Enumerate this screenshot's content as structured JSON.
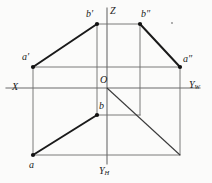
{
  "figure": {
    "kind": "descriptive-geometry-three-view-projection",
    "background_color": "#fbfbfa",
    "ink_color": "#1a1a1a",
    "thin_line_color": "#6b6b6b",
    "canvas": {
      "width": 212,
      "height": 183
    }
  },
  "axes": {
    "origin_label": "O",
    "origin_point": {
      "x": 97,
      "y": 88
    },
    "x_axis": {
      "label": "X",
      "label_pos": {
        "x": 12,
        "y": 82
      },
      "from": {
        "x": 6,
        "y": 88
      },
      "to": {
        "x": 200,
        "y": 88
      }
    },
    "z_axis": {
      "label": "Z",
      "label_pos": {
        "x": 110,
        "y": 6
      },
      "from": {
        "x": 107,
        "y": 8
      },
      "to": {
        "x": 107,
        "y": 88
      }
    },
    "yw_axis": {
      "label": "Y",
      "subscript": "W",
      "label_pos": {
        "x": 189,
        "y": 80
      },
      "from": {
        "x": 107,
        "y": 88
      },
      "to": {
        "x": 200,
        "y": 88
      }
    },
    "yh_axis": {
      "label": "Y",
      "subscript": "H",
      "label_pos": {
        "x": 99,
        "y": 166
      },
      "from": {
        "x": 107,
        "y": 88
      },
      "to": {
        "x": 107,
        "y": 164
      }
    },
    "bisector": {
      "from": {
        "x": 107,
        "y": 88
      },
      "to": {
        "x": 180,
        "y": 155
      }
    }
  },
  "points": [
    {
      "id": "a-prime",
      "label": "a",
      "prime": "′",
      "x": 33,
      "y": 67,
      "label_x": 22,
      "label_y": 52
    },
    {
      "id": "b-prime",
      "label": "b",
      "prime": "′",
      "x": 97,
      "y": 24,
      "label_x": 86,
      "label_y": 9
    },
    {
      "id": "b-dprime",
      "label": "b",
      "prime": "″",
      "x": 140,
      "y": 24,
      "label_x": 141,
      "label_y": 9
    },
    {
      "id": "a-dprime",
      "label": "a",
      "prime": "″",
      "x": 180,
      "y": 67,
      "label_x": 183,
      "label_y": 54
    },
    {
      "id": "b-plan",
      "label": "b",
      "prime": "",
      "x": 97,
      "y": 115,
      "label_x": 99,
      "label_y": 101
    },
    {
      "id": "a-plan",
      "label": "a",
      "prime": "",
      "x": 33,
      "y": 155,
      "label_x": 29,
      "label_y": 160
    }
  ],
  "heavy_segments": [
    {
      "name": "segment-a-prime-b-prime",
      "x1": 33,
      "y1": 67,
      "x2": 97,
      "y2": 24
    },
    {
      "name": "segment-b-dprime-a-dprime",
      "x1": 140,
      "y1": 24,
      "x2": 180,
      "y2": 67
    },
    {
      "name": "segment-a-b-plan",
      "x1": 33,
      "y1": 155,
      "x2": 97,
      "y2": 115
    }
  ],
  "thin_segments": [
    {
      "name": "vline-through-a-prime",
      "x1": 33,
      "y1": 67,
      "x2": 33,
      "y2": 155
    },
    {
      "name": "vline-through-b-prime",
      "x1": 97,
      "y1": 24,
      "x2": 97,
      "y2": 115
    },
    {
      "name": "vline-through-b-dprime",
      "x1": 140,
      "y1": 24,
      "x2": 140,
      "y2": 115
    },
    {
      "name": "vline-through-a-dprime",
      "x1": 180,
      "y1": 67,
      "x2": 180,
      "y2": 155
    },
    {
      "name": "hline-top-b-primes",
      "x1": 97,
      "y1": 24,
      "x2": 140,
      "y2": 24
    },
    {
      "name": "hline-a-primes",
      "x1": 33,
      "y1": 67,
      "x2": 180,
      "y2": 67
    },
    {
      "name": "hline-b-plan",
      "x1": 97,
      "y1": 115,
      "x2": 140,
      "y2": 115
    },
    {
      "name": "hline-bottom-a-plan",
      "x1": 33,
      "y1": 155,
      "x2": 180,
      "y2": 155
    }
  ],
  "stray_mark": {
    "name": "stray-dot",
    "x": 172,
    "y": 23
  }
}
